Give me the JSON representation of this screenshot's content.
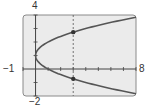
{
  "chart_data": {
    "type": "line",
    "title": "",
    "xlabel": "",
    "ylabel": "",
    "xlim": [
      -1,
      8
    ],
    "ylim": [
      -2,
      4
    ],
    "x_tick_step": 1,
    "y_tick_step": 1,
    "grid": false,
    "series": [
      {
        "name": "x = (y - 1)^2",
        "points": [
          [
            0,
            1
          ],
          [
            0.25,
            1.5
          ],
          [
            0.25,
            0.5
          ],
          [
            1,
            2
          ],
          [
            1,
            0
          ],
          [
            2.25,
            2.5
          ],
          [
            2.25,
            -0.5
          ],
          [
            3,
            2.73
          ],
          [
            3,
            -0.73
          ],
          [
            4,
            3
          ],
          [
            4,
            -1
          ],
          [
            6.25,
            3.5
          ],
          [
            6.25,
            -1.5
          ],
          [
            8,
            3.83
          ],
          [
            8,
            -1.83
          ]
        ]
      }
    ],
    "vertical_line": {
      "x": 3,
      "style": "dashed"
    },
    "marked_points": [
      [
        3,
        2.73
      ],
      [
        3,
        -0.73
      ]
    ],
    "axis_labels": {
      "x_min": "−1",
      "x_max": "8",
      "y_min": "−2",
      "y_max": "4"
    }
  },
  "colors": {
    "plot_bg": "#ebebeb",
    "frame": "#8a8a8a",
    "curve": "#555555",
    "axis": "#444444"
  }
}
